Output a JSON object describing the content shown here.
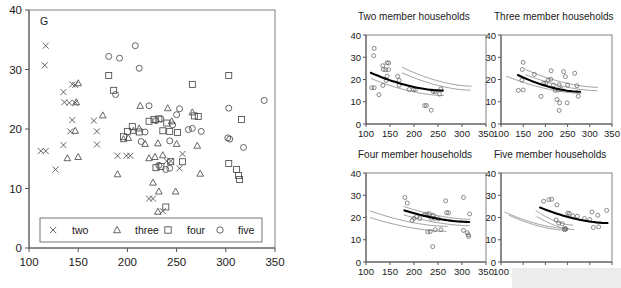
{
  "figure": {
    "corner_label": "G",
    "background": "#ffffff",
    "marker_color": "#4a4a4a",
    "fit_color": "#000000",
    "ci_color": "#8a8a8a"
  },
  "legend": {
    "entries": [
      {
        "symbol": "x-marker",
        "label": "two"
      },
      {
        "symbol": "triangle-marker",
        "label": "three"
      },
      {
        "symbol": "square-marker",
        "label": "four"
      },
      {
        "symbol": "circle-marker",
        "label": "five"
      }
    ]
  },
  "chart_data": [
    {
      "type": "scatter",
      "name": "main-panel",
      "title": "G",
      "xlabel": "",
      "ylabel": "",
      "xlim": [
        100,
        350
      ],
      "ylim": [
        0,
        40
      ],
      "xticks": [
        100,
        150,
        200,
        250,
        300,
        350
      ],
      "yticks": [
        0,
        10,
        20,
        30,
        40
      ],
      "grid": false,
      "legend_position": "bottom-inside",
      "series": [
        {
          "name": "two",
          "marker": "x",
          "points": [
            [
              117,
              34.0
            ],
            [
              116,
              30.7
            ],
            [
              135,
              26.2
            ],
            [
              147,
              27.4
            ],
            [
              144,
              27.5
            ],
            [
              136,
              24.5
            ],
            [
              141,
              24.4
            ],
            [
              147,
              24.4
            ],
            [
              144,
              21.5
            ],
            [
              142,
              19.6
            ],
            [
              166,
              21.4
            ],
            [
              169,
              19.6
            ],
            [
              112,
              16.3
            ],
            [
              117,
              16.3
            ],
            [
              135,
              17.3
            ],
            [
              127,
              13.2
            ],
            [
              169,
              17.4
            ],
            [
              190,
              15.5
            ],
            [
              199,
              15.5
            ],
            [
              203,
              15.5
            ],
            [
              240,
              14.6
            ],
            [
              244,
              14.6
            ],
            [
              253,
              13.4
            ],
            [
              256,
              15.8
            ],
            [
              222,
              8.3
            ],
            [
              226,
              8.3
            ],
            [
              236,
              6.2
            ]
          ]
        },
        {
          "name": "three",
          "marker": "triangle",
          "points": [
            [
              150,
              27.7
            ],
            [
              148,
              24.5
            ],
            [
              147,
              19.7
            ],
            [
              175,
              22.3
            ],
            [
              139,
              15.1
            ],
            [
              150,
              15.3
            ],
            [
              196,
              18.3
            ],
            [
              201,
              18.5
            ],
            [
              206,
              19.7
            ],
            [
              212,
              20.1
            ],
            [
              218,
              17.5
            ],
            [
              222,
              15.1
            ],
            [
              228,
              15.3
            ],
            [
              231,
              17.6
            ],
            [
              236,
              15.6
            ],
            [
              241,
              23.5
            ],
            [
              245,
              21.3
            ],
            [
              250,
              17.5
            ],
            [
              266,
              22.8
            ],
            [
              271,
              17.2
            ],
            [
              274,
              12.5
            ],
            [
              213,
              23.9
            ],
            [
              190,
              12.4
            ],
            [
              226,
              11.0
            ],
            [
              232,
              9.5
            ],
            [
              249,
              9.5
            ],
            [
              231,
              6.1
            ]
          ]
        },
        {
          "name": "four",
          "marker": "square",
          "points": [
            [
              181,
              29.0
            ],
            [
              186,
              26.5
            ],
            [
              266,
              27.5
            ],
            [
              303,
              29.0
            ],
            [
              222,
              21.3
            ],
            [
              227,
              21.6
            ],
            [
              232,
              21.7
            ],
            [
              205,
              20.4
            ],
            [
              196,
              18.7
            ],
            [
              200,
              19.6
            ],
            [
              212,
              19.5
            ],
            [
              236,
              19.7
            ],
            [
              243,
              19.6
            ],
            [
              251,
              19.4
            ],
            [
              240,
              21.0
            ],
            [
              268,
              22.2
            ],
            [
              272,
              22.1
            ],
            [
              316,
              21.6
            ],
            [
              229,
              13.5
            ],
            [
              234,
              13.7
            ],
            [
              244,
              14.5
            ],
            [
              256,
              14.5
            ],
            [
              311,
              13.2
            ],
            [
              313,
              12.2
            ],
            [
              314,
              11.5
            ],
            [
              303,
              14.2
            ],
            [
              239,
              6.9
            ]
          ]
        },
        {
          "name": "five",
          "marker": "circle",
          "points": [
            [
              208,
              34.0
            ],
            [
              181,
              32.2
            ],
            [
              192,
              31.9
            ],
            [
              212,
              30.2
            ],
            [
              303,
              23.5
            ],
            [
              250,
              22.4
            ],
            [
              253,
              23.4
            ],
            [
              188,
              25.8
            ],
            [
              302,
              18.5
            ],
            [
              304,
              18.3
            ],
            [
              318,
              16.9
            ],
            [
              339,
              24.8
            ],
            [
              222,
              23.9
            ],
            [
              229,
              21.4
            ],
            [
              234,
              21.7
            ],
            [
              246,
              20.7
            ],
            [
              262,
              19.9
            ],
            [
              275,
              19.6
            ],
            [
              218,
              19.5
            ],
            [
              214,
              17.9
            ],
            [
              243,
              18.0
            ],
            [
              239,
              13.2
            ],
            [
              243,
              13.4
            ],
            [
              266,
              20.1
            ],
            [
              232,
              13.9
            ]
          ]
        }
      ]
    },
    {
      "type": "scatter",
      "name": "two-member-panel",
      "title": "Two member households",
      "xlim": [
        100,
        350
      ],
      "ylim": [
        0,
        40
      ],
      "xticks": [
        100,
        150,
        200,
        250,
        300,
        350
      ],
      "yticks": [
        0,
        10,
        20,
        30,
        40
      ],
      "grid": false,
      "points": [
        [
          117,
          34.0
        ],
        [
          116,
          30.7
        ],
        [
          135,
          26.2
        ],
        [
          147,
          27.4
        ],
        [
          144,
          27.5
        ],
        [
          136,
          24.5
        ],
        [
          141,
          24.4
        ],
        [
          147,
          24.4
        ],
        [
          144,
          21.5
        ],
        [
          142,
          19.6
        ],
        [
          166,
          21.4
        ],
        [
          169,
          19.6
        ],
        [
          112,
          16.3
        ],
        [
          117,
          16.3
        ],
        [
          135,
          17.3
        ],
        [
          127,
          13.2
        ],
        [
          169,
          17.4
        ],
        [
          190,
          15.5
        ],
        [
          199,
          15.5
        ],
        [
          203,
          15.5
        ],
        [
          240,
          14.6
        ],
        [
          244,
          14.6
        ],
        [
          253,
          13.4
        ],
        [
          256,
          15.8
        ],
        [
          222,
          8.3
        ],
        [
          226,
          8.3
        ],
        [
          236,
          6.2
        ]
      ],
      "fit_curve": {
        "x": [
          110,
          260
        ],
        "y": [
          23.0,
          15.0
        ],
        "label": "regression-fit"
      },
      "ci_curves": [
        {
          "x": [
            110,
            262
          ],
          "y": [
            20.5,
            12.8
          ],
          "label": "lower-band"
        },
        {
          "x": [
            175,
            320
          ],
          "y": [
            25.5,
            17.0
          ],
          "label": "upper-band-1"
        },
        {
          "x": [
            175,
            318
          ],
          "y": [
            23.0,
            15.2
          ],
          "label": "upper-band-2"
        }
      ]
    },
    {
      "type": "scatter",
      "name": "three-member-panel",
      "title": "Three member households",
      "xlim": [
        100,
        350
      ],
      "ylim": [
        0,
        40
      ],
      "xticks": [
        100,
        150,
        200,
        250,
        300,
        350
      ],
      "yticks": [
        0,
        10,
        20,
        30,
        40
      ],
      "grid": false,
      "points": [
        [
          150,
          27.7
        ],
        [
          148,
          24.5
        ],
        [
          147,
          19.7
        ],
        [
          175,
          22.3
        ],
        [
          139,
          15.1
        ],
        [
          150,
          15.3
        ],
        [
          196,
          18.3
        ],
        [
          201,
          18.5
        ],
        [
          206,
          19.7
        ],
        [
          212,
          20.1
        ],
        [
          218,
          17.5
        ],
        [
          222,
          15.1
        ],
        [
          228,
          15.3
        ],
        [
          231,
          17.6
        ],
        [
          236,
          15.6
        ],
        [
          241,
          23.5
        ],
        [
          245,
          21.3
        ],
        [
          250,
          17.5
        ],
        [
          266,
          22.8
        ],
        [
          271,
          17.2
        ],
        [
          274,
          12.5
        ],
        [
          213,
          23.9
        ],
        [
          190,
          12.4
        ],
        [
          226,
          11.0
        ],
        [
          232,
          9.5
        ],
        [
          249,
          9.5
        ],
        [
          231,
          6.1
        ]
      ],
      "fit_curve": {
        "x": [
          138,
          278
        ],
        "y": [
          22.0,
          14.5
        ],
        "label": "regression-fit"
      },
      "ci_curves": [
        {
          "x": [
            112,
            282
          ],
          "y": [
            21.5,
            13.8
          ],
          "label": "lower-band"
        },
        {
          "x": [
            155,
            318
          ],
          "y": [
            24.5,
            16.5
          ],
          "label": "upper-band-1"
        },
        {
          "x": [
            155,
            316
          ],
          "y": [
            22.2,
            15.0
          ],
          "label": "upper-band-2"
        }
      ]
    },
    {
      "type": "scatter",
      "name": "four-member-panel",
      "title": "Four member households",
      "xlim": [
        100,
        350
      ],
      "ylim": [
        0,
        40
      ],
      "xticks": [
        100,
        150,
        200,
        250,
        300,
        350
      ],
      "yticks": [
        0,
        10,
        20,
        30,
        40
      ],
      "grid": false,
      "points": [
        [
          181,
          29.0
        ],
        [
          186,
          26.5
        ],
        [
          266,
          27.5
        ],
        [
          303,
          29.0
        ],
        [
          222,
          21.3
        ],
        [
          227,
          21.6
        ],
        [
          232,
          21.7
        ],
        [
          205,
          20.4
        ],
        [
          196,
          18.7
        ],
        [
          200,
          19.6
        ],
        [
          212,
          19.5
        ],
        [
          236,
          19.7
        ],
        [
          243,
          19.6
        ],
        [
          251,
          19.4
        ],
        [
          240,
          21.0
        ],
        [
          268,
          22.2
        ],
        [
          272,
          22.1
        ],
        [
          316,
          21.6
        ],
        [
          229,
          13.5
        ],
        [
          234,
          13.7
        ],
        [
          244,
          14.5
        ],
        [
          256,
          14.5
        ],
        [
          311,
          13.2
        ],
        [
          313,
          12.2
        ],
        [
          314,
          11.5
        ],
        [
          303,
          14.2
        ],
        [
          239,
          6.9
        ]
      ],
      "fit_curve": {
        "x": [
          180,
          315
        ],
        "y": [
          23.2,
          18.0
        ],
        "label": "regression-fit"
      },
      "ci_curves": [
        {
          "x": [
            108,
            270
          ],
          "y": [
            23.0,
            16.0
          ],
          "label": "upper-band"
        },
        {
          "x": [
            108,
            268
          ],
          "y": [
            20.0,
            13.8
          ],
          "label": "lower-band"
        },
        {
          "x": [
            178,
            318
          ],
          "y": [
            25.0,
            19.2
          ],
          "label": "fit-upper"
        },
        {
          "x": [
            178,
            316
          ],
          "y": [
            21.2,
            16.3
          ],
          "label": "fit-lower"
        }
      ]
    },
    {
      "type": "scatter",
      "name": "five-member-panel",
      "title": "Five member households",
      "xlim": [
        100,
        350
      ],
      "ylim": [
        0,
        40
      ],
      "xticks": [
        100,
        150,
        200,
        250,
        300,
        350
      ],
      "yticks": [
        0,
        10,
        20,
        30,
        40
      ],
      "grid": false,
      "points": [
        [
          208,
          28.0
        ],
        [
          196,
          27.3
        ],
        [
          214,
          28.2
        ],
        [
          226,
          25.7
        ],
        [
          250,
          22.0
        ],
        [
          254,
          21.8
        ],
        [
          262,
          20.8
        ],
        [
          272,
          20.6
        ],
        [
          288,
          19.5
        ],
        [
          300,
          19.1
        ],
        [
          224,
          18.9
        ],
        [
          230,
          17.5
        ],
        [
          238,
          17.2
        ],
        [
          244,
          15.2
        ],
        [
          246,
          14.8
        ],
        [
          243,
          14.5
        ],
        [
          305,
          22.5
        ],
        [
          318,
          21.0
        ],
        [
          338,
          23.2
        ],
        [
          308,
          15.5
        ],
        [
          320,
          15.8
        ]
      ],
      "fit_curve": {
        "x": [
          188,
          340
        ],
        "y": [
          24.5,
          17.5
        ],
        "label": "regression-fit"
      },
      "ci_curves": [
        {
          "x": [
            108,
            252
          ],
          "y": [
            22.5,
            15.0
          ],
          "label": "lower-band-outer"
        },
        {
          "x": [
            118,
            250
          ],
          "y": [
            21.0,
            14.2
          ],
          "label": "lower-band-inner"
        },
        {
          "x": [
            178,
            262
          ],
          "y": [
            23.2,
            16.6
          ],
          "label": "mid-band-1"
        },
        {
          "x": [
            180,
            265
          ],
          "y": [
            20.5,
            14.6
          ],
          "label": "mid-band-2"
        }
      ]
    }
  ]
}
